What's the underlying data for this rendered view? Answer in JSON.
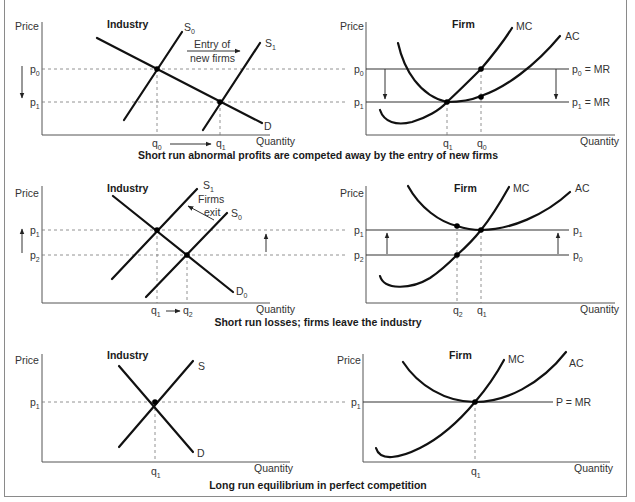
{
  "axis_labels": {
    "y": "Price",
    "x": "Quantity"
  },
  "panels": [
    {
      "industry": {
        "title": "Industry",
        "price_labels": [
          {
            "base": "p",
            "sub": "0"
          },
          {
            "base": "p",
            "sub": "1"
          }
        ],
        "quantity_labels": [
          {
            "base": "q",
            "sub": "0"
          },
          {
            "base": "q",
            "sub": "1"
          }
        ],
        "curves": [
          {
            "base": "S",
            "sub": "0"
          },
          {
            "base": "S",
            "sub": "1"
          },
          {
            "base": "D",
            "sub": ""
          }
        ],
        "annotation": [
          "Entry of",
          "new firms"
        ],
        "price_arrow": "down"
      },
      "firm": {
        "title": "Firm",
        "price_labels": [
          {
            "base": "p",
            "sub": "0"
          },
          {
            "base": "p",
            "sub": "1"
          }
        ],
        "quantity_labels": [
          {
            "base": "q",
            "sub": "1"
          },
          {
            "base": "q",
            "sub": "0"
          }
        ],
        "curves": [
          "MC",
          "AC"
        ],
        "right_labels": [
          {
            "base": "p",
            "sub": "0",
            "suffix": " = MR"
          },
          {
            "base": "p",
            "sub": "1",
            "suffix": " = MR"
          }
        ]
      },
      "caption": "Short run abnormal profits are competed away by the entry of new firms"
    },
    {
      "industry": {
        "title": "Industry",
        "price_labels": [
          {
            "base": "p",
            "sub": "1"
          },
          {
            "base": "p",
            "sub": "2"
          }
        ],
        "quantity_labels": [
          {
            "base": "q",
            "sub": "1"
          },
          {
            "base": "q",
            "sub": "2"
          }
        ],
        "curves": [
          {
            "base": "S",
            "sub": "1"
          },
          {
            "base": "S",
            "sub": "0"
          },
          {
            "base": "D",
            "sub": "0"
          }
        ],
        "annotation": [
          "Firms",
          "exit"
        ],
        "price_arrow": "up"
      },
      "firm": {
        "title": "Firm",
        "price_labels": [
          {
            "base": "p",
            "sub": "1"
          },
          {
            "base": "p",
            "sub": "2"
          }
        ],
        "quantity_labels": [
          {
            "base": "q",
            "sub": "2"
          },
          {
            "base": "q",
            "sub": "1"
          }
        ],
        "curves": [
          "MC",
          "AC"
        ],
        "right_labels": [
          {
            "base": "p",
            "sub": "1",
            "suffix": ""
          },
          {
            "base": "p",
            "sub": "0",
            "suffix": ""
          }
        ]
      },
      "caption": "Short run losses; firms leave the industry"
    },
    {
      "industry": {
        "title": "Industry",
        "price_labels": [
          {
            "base": "p",
            "sub": "1"
          }
        ],
        "quantity_labels": [
          {
            "base": "q",
            "sub": "1"
          }
        ],
        "curves": [
          {
            "base": "S",
            "sub": ""
          },
          {
            "base": "D",
            "sub": ""
          }
        ]
      },
      "firm": {
        "title": "Firm",
        "price_labels": [
          {
            "base": "p",
            "sub": "1"
          }
        ],
        "quantity_labels": [
          {
            "base": "q",
            "sub": "1"
          }
        ],
        "curves": [
          "MC",
          "AC"
        ],
        "right_labels": [
          {
            "base": "P = MR",
            "sub": "",
            "suffix": ""
          }
        ]
      },
      "caption": "Long run equilibrium in perfect competition"
    }
  ]
}
